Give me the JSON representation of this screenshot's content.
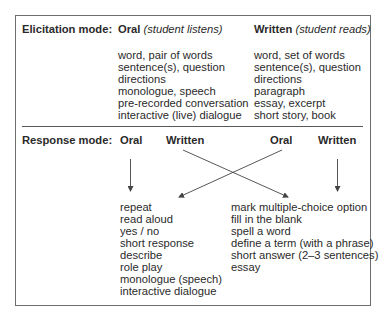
{
  "elicitation": {
    "label": "Elicitation mode:",
    "oral": {
      "title": "Oral",
      "subtitle": "(student listens)",
      "items": [
        "word, pair of words",
        "sentence(s), question",
        "directions",
        "monologue, speech",
        "pre-recorded conversation",
        "interactive (live) dialogue"
      ]
    },
    "written": {
      "title": "Written",
      "subtitle": "(student reads)",
      "items": [
        "word, set of words",
        "sentence(s), question",
        "directions",
        "paragraph",
        "essay, excerpt",
        "short story, book"
      ]
    }
  },
  "response": {
    "label": "Response mode:",
    "headers": {
      "left_oral": "Oral",
      "left_written": "Written",
      "right_oral": "Oral",
      "right_written": "Written"
    },
    "oral_items": [
      "repeat",
      "read aloud",
      "yes / no",
      "short response",
      "describe",
      "role play",
      "monologue (speech)",
      "interactive dialogue"
    ],
    "written_items": [
      "mark multiple-choice option",
      "fill in the blank",
      "spell a word",
      "define a term (with a phrase)",
      "short answer (2–3 sentences)",
      "essay"
    ]
  },
  "arrows": [
    {
      "from": "left_oral",
      "to": "oral_items",
      "type": "vertical"
    },
    {
      "from": "left_written",
      "to": "written_items",
      "type": "diagonal"
    },
    {
      "from": "right_oral",
      "to": "oral_items",
      "type": "diagonal"
    },
    {
      "from": "right_written",
      "to": "written_items",
      "type": "vertical"
    }
  ],
  "colors": {
    "text": "#2a2a2a",
    "border": "#6e6e6e",
    "arrow": "#444444"
  }
}
